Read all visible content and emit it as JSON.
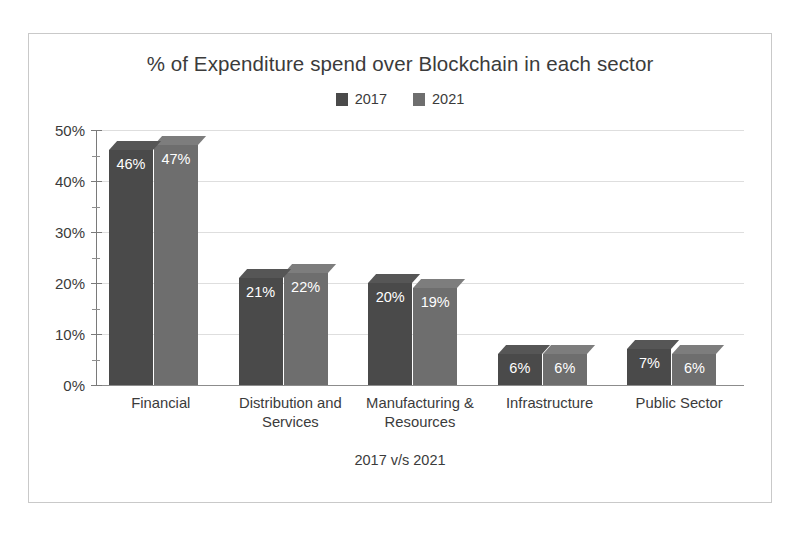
{
  "chart_data": {
    "type": "bar",
    "title": "% of Expenditure spend over Blockchain in each sector",
    "subtitle": "",
    "xlabel": "2017 v/s 2021",
    "ylabel": "",
    "categories": [
      "Financial",
      "Distribution and Services",
      "Manufacturing & Resources",
      "Infrastructure",
      "Public Sector"
    ],
    "series": [
      {
        "name": "2017",
        "color": "#4a4a4a",
        "values": [
          46,
          21,
          20,
          6,
          7
        ],
        "labels": [
          "46%",
          "21%",
          "20%",
          "6%",
          "7%"
        ]
      },
      {
        "name": "2021",
        "color": "#6e6e6e",
        "values": [
          47,
          22,
          19,
          6,
          6
        ],
        "labels": [
          "47%",
          "22%",
          "19%",
          "6%",
          "6%"
        ]
      }
    ],
    "ylim": [
      0,
      50
    ],
    "y_ticks": [
      0,
      10,
      20,
      30,
      40,
      50
    ],
    "y_tick_labels": [
      "0%",
      "10%",
      "20%",
      "30%",
      "40%",
      "50%"
    ],
    "y_minor_step": 5,
    "value_unit": "%",
    "grid": true,
    "grid_orientation": "horizontal",
    "legend_position": "top",
    "style": "3d-column",
    "colors": {
      "series_2017": "#4a4a4a",
      "series_2021": "#6e6e6e",
      "text": "#3b3b3b",
      "gridline": "#dedede",
      "axis": "#7a7a7a",
      "frame_border": "#c9c9c9",
      "background": "#ffffff",
      "value_label": "#ffffff"
    }
  }
}
